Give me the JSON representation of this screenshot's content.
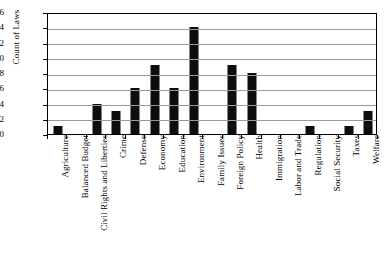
{
  "chart_data": {
    "type": "bar",
    "title": "",
    "xlabel": "",
    "ylabel": "Count of Laws",
    "ylim": [
      0,
      16
    ],
    "ytick_step": 2,
    "yticks": [
      0,
      2,
      4,
      6,
      8,
      10,
      12,
      14,
      16
    ],
    "grid": true,
    "legend": null,
    "bar_color": "#0d0d0d",
    "categories": [
      "Agriculture",
      "Balanced Budget",
      "Civil Rights and Liberties",
      "Crime",
      "Defense",
      "Economy",
      "Education",
      "Environment",
      "Family Issues",
      "Foreign Policy",
      "Health",
      "Immigration",
      "Labor and Trade",
      "Regulation",
      "Social Security",
      "Taxes",
      "Welfare"
    ],
    "values": [
      1,
      0,
      4,
      3,
      6,
      9,
      6,
      14,
      0,
      9,
      8,
      0,
      0,
      1,
      0,
      1,
      3
    ]
  }
}
